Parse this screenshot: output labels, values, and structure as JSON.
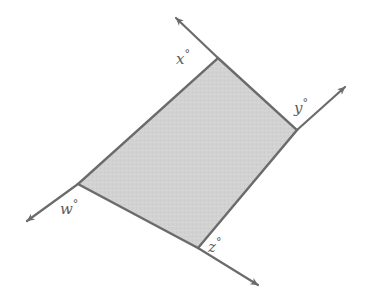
{
  "figure": {
    "name": "exterior-angles-parallelogram",
    "type": "geometry-diagram",
    "background_color": "#ffffff",
    "shape": {
      "kind": "parallelogram",
      "fill_color": "#d2d2d2",
      "stroke_color": "#6b6b6b",
      "stroke_width": 2.4,
      "vertices": [
        {
          "id": "top",
          "x": 218,
          "y": 58
        },
        {
          "id": "right",
          "x": 297,
          "y": 130
        },
        {
          "id": "bottom",
          "x": 198,
          "y": 248
        },
        {
          "id": "left",
          "x": 78,
          "y": 184
        }
      ]
    },
    "rays": [
      {
        "id": "ray-top-left",
        "from_vertex": "top",
        "from": {
          "x": 218,
          "y": 58
        },
        "to": {
          "x": 176,
          "y": 18
        },
        "arrowhead": "end",
        "stroke_color": "#6b6b6b"
      },
      {
        "id": "ray-upper-right",
        "from_vertex": "right",
        "from": {
          "x": 297,
          "y": 130
        },
        "to": {
          "x": 345,
          "y": 87
        },
        "arrowhead": "end",
        "stroke_color": "#6b6b6b"
      },
      {
        "id": "ray-lower-left",
        "from_vertex": "left",
        "from": {
          "x": 78,
          "y": 184
        },
        "to": {
          "x": 27,
          "y": 221
        },
        "arrowhead": "end",
        "stroke_color": "#6b6b6b"
      },
      {
        "id": "ray-lower-right",
        "from_vertex": "bottom",
        "from": {
          "x": 198,
          "y": 248
        },
        "to": {
          "x": 258,
          "y": 285
        },
        "arrowhead": "end",
        "stroke_color": "#6b6b6b"
      }
    ],
    "labels": {
      "x": {
        "text": "x",
        "degree": "°",
        "vertex": "top"
      },
      "y": {
        "text": "y",
        "degree": "°",
        "vertex": "right"
      },
      "w": {
        "text": "w",
        "degree": "°",
        "vertex": "left"
      },
      "z": {
        "text": "z",
        "degree": "°",
        "vertex": "bottom"
      }
    },
    "label_color": "#5c5c5c"
  }
}
